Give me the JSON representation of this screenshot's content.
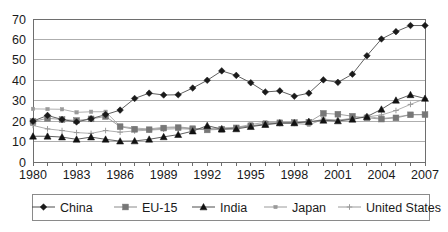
{
  "chart_data": {
    "type": "line",
    "title": "",
    "xlabel": "",
    "ylabel": "",
    "xlim": [
      1980,
      2007
    ],
    "ylim": [
      0,
      70
    ],
    "ytick_step": 10,
    "grid": true,
    "legend_position": "bottom",
    "x": [
      1980,
      1981,
      1982,
      1983,
      1984,
      1985,
      1986,
      1987,
      1988,
      1989,
      1990,
      1991,
      1992,
      1993,
      1994,
      1995,
      1996,
      1997,
      1998,
      1999,
      2000,
      2001,
      2002,
      2003,
      2004,
      2005,
      2006,
      2007
    ],
    "xtick_labels": [
      "1980",
      "1983",
      "1986",
      "1989",
      "1992",
      "1995",
      "1998",
      "2001",
      "2004",
      "2007"
    ],
    "xtick_values": [
      1980,
      1983,
      1986,
      1989,
      1992,
      1995,
      1998,
      2001,
      2004,
      2007
    ],
    "ytick_labels": [
      "0",
      "10",
      "20",
      "30",
      "40",
      "50",
      "60",
      "70"
    ],
    "ytick_values": [
      0,
      10,
      20,
      30,
      40,
      50,
      60,
      70
    ],
    "series": [
      {
        "name": "China",
        "marker": "diamond",
        "color": "#1a1a1a",
        "line_color": "#4d4d4d",
        "values": [
          20.0,
          22.8,
          20.8,
          19.6,
          21.2,
          23.2,
          25.4,
          31.1,
          33.7,
          32.8,
          32.9,
          36.2,
          40.0,
          44.6,
          42.4,
          38.8,
          34.3,
          34.8,
          32.2,
          33.7,
          40.2,
          39.0,
          43.0,
          52.0,
          60.2,
          63.8,
          66.8,
          66.8
        ]
      },
      {
        "name": "EU-15",
        "marker": "square",
        "color": "#777777",
        "line_color": "#8a8a8a",
        "values": [
          19.8,
          21.4,
          20.8,
          20.3,
          21.1,
          22.3,
          17.3,
          16.0,
          15.8,
          16.6,
          16.8,
          16.3,
          15.7,
          16.0,
          16.7,
          17.7,
          18.6,
          19.2,
          19.3,
          19.5,
          23.8,
          23.4,
          22.4,
          21.6,
          21.0,
          21.6,
          23.1,
          23.2
        ]
      },
      {
        "name": "India",
        "marker": "triangle",
        "color": "#111111",
        "line_color": "#4d4d4d",
        "values": [
          12.6,
          12.6,
          12.2,
          11.1,
          12.2,
          11.1,
          10.2,
          10.3,
          11.1,
          12.3,
          13.4,
          15.1,
          17.8,
          16.1,
          16.2,
          17.3,
          18.3,
          19.1,
          19.1,
          19.8,
          20.4,
          20.1,
          20.9,
          22.2,
          25.8,
          30.2,
          32.9,
          31.1
        ]
      },
      {
        "name": "Japan",
        "marker": "small-square",
        "color": "#9a9a9a",
        "line_color": "#9a9a9a",
        "values": [
          26.0,
          25.9,
          25.8,
          24.3,
          24.6,
          24.6,
          17.5,
          16.6,
          16.2,
          17.0,
          17.2,
          16.5,
          16.0,
          16.4,
          16.9,
          18.4,
          19.4,
          19.2,
          18.9,
          18.2,
          20.9,
          20.3,
          21.2,
          22.3,
          21.3,
          22.0,
          23.2,
          23.2
        ]
      },
      {
        "name": "United States",
        "marker": "plus",
        "color": "#9a9a9a",
        "line_color": "#9a9a9a",
        "values": [
          17.9,
          16.2,
          15.4,
          14.4,
          14.0,
          15.4,
          14.6,
          15.2,
          15.6,
          16.0,
          16.3,
          16.0,
          16.3,
          16.7,
          16.8,
          17.7,
          18.4,
          18.8,
          18.9,
          19.3,
          21.0,
          20.5,
          21.4,
          22.1,
          23.0,
          25.2,
          28.2,
          31.0
        ]
      }
    ]
  },
  "legend": {
    "items": [
      {
        "label": "China"
      },
      {
        "label": "EU-15"
      },
      {
        "label": "India"
      },
      {
        "label": "Japan"
      },
      {
        "label": "United States"
      }
    ]
  }
}
